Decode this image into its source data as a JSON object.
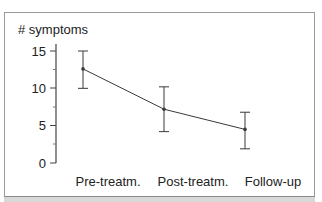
{
  "chart_data": {
    "type": "line",
    "title": "",
    "xlabel": "",
    "ylabel": "# symptoms",
    "categories": [
      "Pre-treatm.",
      "Post-treatm.",
      "Follow-up"
    ],
    "series": [
      {
        "name": "# symptoms",
        "values": [
          12.6,
          7.2,
          4.5
        ],
        "error_upper": [
          15.0,
          10.2,
          6.8
        ],
        "error_lower": [
          10.0,
          4.2,
          1.9
        ]
      }
    ],
    "ylim": [
      0,
      15
    ],
    "yticks": [
      0,
      5,
      10,
      15
    ],
    "ytick_labels": [
      "0",
      "5",
      "10",
      "15"
    ],
    "minor_yticks": [
      2.5,
      7.5,
      12.5
    ],
    "grid": false,
    "legend": null,
    "error_bars": true
  },
  "labels": {
    "ylabel": "# symptoms",
    "yticks": [
      "15",
      "10",
      "5",
      "0"
    ],
    "categories": [
      "Pre-treatm.",
      "Post-treatm.",
      "Follow-up"
    ]
  },
  "colors": {
    "line": "#3a3a3a",
    "axis": "#444444",
    "frame": "#9a9a9a",
    "text": "#222222"
  }
}
